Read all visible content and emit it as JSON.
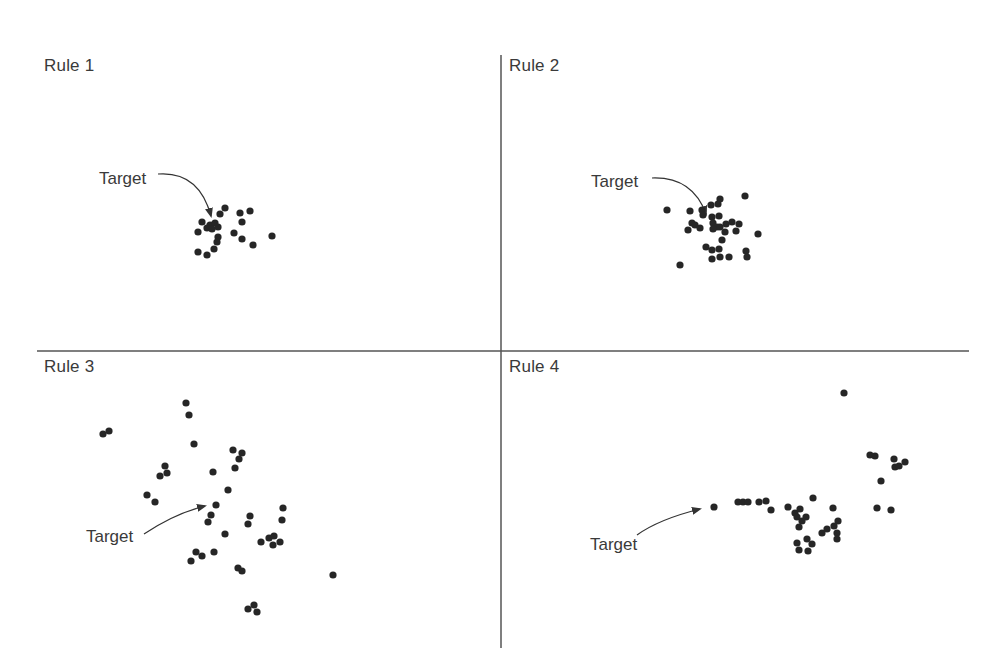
{
  "figure": {
    "colors": {
      "dot": "#262626",
      "line": "#555555",
      "text": "#3a3a3a"
    },
    "dividers": {
      "vertical": {
        "x": 501,
        "y1": 55,
        "y2": 648
      },
      "horizontal": {
        "y": 351,
        "x1": 37,
        "x2": 969
      }
    },
    "quadrants": [
      {
        "label": "Rule 1",
        "label_pos": [
          44,
          56
        ],
        "target_label": "Target",
        "target_label_pos": [
          99,
          169
        ],
        "arrow_path": "M158,174 C185,172 203,186 211,216",
        "arrow_head": [
          211,
          219
        ],
        "dots": [
          [
            225,
            208
          ],
          [
            220,
            214
          ],
          [
            240,
            213
          ],
          [
            250,
            211
          ],
          [
            242,
            222
          ],
          [
            202,
            222
          ],
          [
            210,
            225
          ],
          [
            215,
            223
          ],
          [
            218,
            227
          ],
          [
            207,
            228
          ],
          [
            212,
            229
          ],
          [
            198,
            232
          ],
          [
            234,
            233
          ],
          [
            218,
            237
          ],
          [
            217,
            242
          ],
          [
            242,
            239
          ],
          [
            272,
            236
          ],
          [
            253,
            245
          ],
          [
            214,
            249
          ],
          [
            198,
            252
          ],
          [
            207,
            255
          ]
        ]
      },
      {
        "label": "Rule 2",
        "label_pos": [
          509,
          56
        ],
        "target_label": "Target",
        "target_label_pos": [
          591,
          172
        ],
        "arrow_path": "M652,178 C680,177 697,189 706,214",
        "arrow_head": [
          708,
          218
        ],
        "dots": [
          [
            667,
            210
          ],
          [
            690,
            211
          ],
          [
            711,
            205
          ],
          [
            718,
            204
          ],
          [
            720,
            199
          ],
          [
            745,
            196
          ],
          [
            702,
            210
          ],
          [
            703,
            215
          ],
          [
            712,
            217
          ],
          [
            719,
            216
          ],
          [
            692,
            223
          ],
          [
            695,
            225
          ],
          [
            700,
            228
          ],
          [
            688,
            230
          ],
          [
            713,
            223
          ],
          [
            717,
            227
          ],
          [
            713,
            229
          ],
          [
            720,
            227
          ],
          [
            726,
            224
          ],
          [
            732,
            222
          ],
          [
            739,
            224
          ],
          [
            725,
            232
          ],
          [
            736,
            231
          ],
          [
            758,
            234
          ],
          [
            722,
            240
          ],
          [
            706,
            247
          ],
          [
            712,
            250
          ],
          [
            719,
            249
          ],
          [
            746,
            251
          ],
          [
            747,
            257
          ],
          [
            712,
            259
          ],
          [
            720,
            257
          ],
          [
            729,
            257
          ],
          [
            680,
            265
          ]
        ]
      },
      {
        "label": "Rule 3",
        "label_pos": [
          44,
          357
        ],
        "target_label": "Target",
        "target_label_pos": [
          86,
          527
        ],
        "arrow_path": "M144,534 C165,520 185,511 205,506",
        "arrow_head": [
          208,
          505
        ],
        "dots": [
          [
            103,
            434
          ],
          [
            109,
            431
          ],
          [
            186,
            403
          ],
          [
            189,
            415
          ],
          [
            194,
            444
          ],
          [
            233,
            450
          ],
          [
            242,
            453
          ],
          [
            239,
            459
          ],
          [
            235,
            468
          ],
          [
            165,
            466
          ],
          [
            160,
            476
          ],
          [
            167,
            473
          ],
          [
            213,
            472
          ],
          [
            228,
            490
          ],
          [
            147,
            495
          ],
          [
            155,
            502
          ],
          [
            216,
            505
          ],
          [
            211,
            515
          ],
          [
            208,
            522
          ],
          [
            250,
            516
          ],
          [
            248,
            524
          ],
          [
            283,
            508
          ],
          [
            282,
            520
          ],
          [
            225,
            534
          ],
          [
            261,
            542
          ],
          [
            269,
            538
          ],
          [
            274,
            536
          ],
          [
            273,
            545
          ],
          [
            280,
            542
          ],
          [
            196,
            552
          ],
          [
            202,
            556
          ],
          [
            191,
            561
          ],
          [
            214,
            552
          ],
          [
            238,
            568
          ],
          [
            242,
            571
          ],
          [
            333,
            575
          ],
          [
            248,
            609
          ],
          [
            254,
            605
          ],
          [
            257,
            612
          ]
        ]
      },
      {
        "label": "Rule 4",
        "label_pos": [
          509,
          357
        ],
        "target_label": "Target",
        "target_label_pos": [
          590,
          535
        ],
        "arrow_path": "M637,535 C655,522 680,514 700,509",
        "arrow_head": [
          703,
          508
        ],
        "dots": [
          [
            844,
            393
          ],
          [
            714,
            507
          ],
          [
            738,
            502
          ],
          [
            743,
            502
          ],
          [
            748,
            502
          ],
          [
            759,
            502
          ],
          [
            766,
            501
          ],
          [
            771,
            510
          ],
          [
            788,
            507
          ],
          [
            813,
            498
          ],
          [
            795,
            513
          ],
          [
            800,
            509
          ],
          [
            797,
            517
          ],
          [
            806,
            517
          ],
          [
            802,
            521
          ],
          [
            799,
            527
          ],
          [
            797,
            543
          ],
          [
            799,
            550
          ],
          [
            807,
            539
          ],
          [
            812,
            544
          ],
          [
            808,
            551
          ],
          [
            833,
            508
          ],
          [
            822,
            533
          ],
          [
            827,
            529
          ],
          [
            834,
            526
          ],
          [
            838,
            521
          ],
          [
            837,
            533
          ],
          [
            837,
            539
          ],
          [
            870,
            455
          ],
          [
            875,
            456
          ],
          [
            894,
            459
          ],
          [
            905,
            462
          ],
          [
            895,
            467
          ],
          [
            899,
            466
          ],
          [
            881,
            481
          ],
          [
            877,
            508
          ],
          [
            891,
            510
          ]
        ]
      }
    ]
  }
}
